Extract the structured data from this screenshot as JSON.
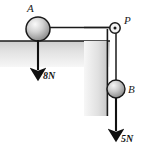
{
  "figure": {
    "labels": {
      "ball_a": "A",
      "pulley": "P",
      "ball_b": "B"
    },
    "forces": [
      {
        "name": "weight-a",
        "label": "8N",
        "value": 8,
        "unit": "N",
        "direction": "down"
      },
      {
        "name": "weight-b",
        "label": "5N",
        "value": 5,
        "unit": "N",
        "direction": "down"
      }
    ],
    "colors": {
      "wall_fill_light": "#f2f2f2",
      "wall_fill_dark": "#b9b9b9",
      "outline": "#1a1a1a",
      "ball_light": "#f0f0f0",
      "ball_dark": "#8e8e8e",
      "background": "#ffffff"
    },
    "geometry": {
      "ball_a": {
        "cx": 38,
        "cy": 29,
        "r": 12
      },
      "pulley": {
        "cx": 115,
        "cy": 28,
        "r": 5
      },
      "ball_b": {
        "cx": 116,
        "cy": 89,
        "r": 9
      },
      "surface_y": 41,
      "wall_x": 107
    }
  }
}
